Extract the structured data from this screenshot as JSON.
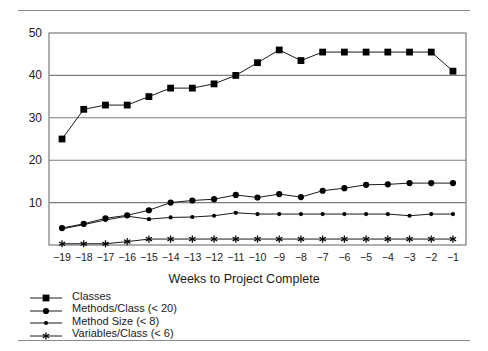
{
  "chart_data": {
    "type": "line",
    "title": "",
    "subtitle": "",
    "xlabel": "Weeks to Project Complete",
    "ylabel": "",
    "x": [
      -19,
      -18,
      -17,
      -16,
      -15,
      -14,
      -13,
      -12,
      -11,
      -10,
      -9,
      -8,
      -7,
      -6,
      -5,
      -4,
      -3,
      -2,
      -1
    ],
    "categories": [
      "-19",
      "-18",
      "-17",
      "-16",
      "-15",
      "-14",
      "-13",
      "-12",
      "-11",
      "-10",
      "-9",
      "-8",
      "-7",
      "-6",
      "-5",
      "-4",
      "-3",
      "-2",
      "-1"
    ],
    "xlim": [
      -19.6,
      -0.4
    ],
    "ylim": [
      0,
      50
    ],
    "yticks": [
      10,
      20,
      30,
      40,
      50
    ],
    "grid": true,
    "legend_position": "below-left",
    "series": [
      {
        "name": "Classes",
        "marker": "square",
        "color": "#000000",
        "values": [
          25,
          32,
          33,
          33,
          35,
          37,
          37,
          38,
          40,
          43,
          46,
          43.5,
          45.5,
          45.5,
          45.5,
          45.5,
          45.5,
          45.5,
          41
        ]
      },
      {
        "name": "Methods/Class (< 20)",
        "marker": "circle-large",
        "color": "#000000",
        "values": [
          4,
          5,
          6.3,
          7,
          8.2,
          10,
          10.5,
          10.8,
          11.8,
          11.2,
          12,
          11.3,
          12.8,
          13.4,
          14.2,
          14.3,
          14.6,
          14.6,
          14.6
        ]
      },
      {
        "name": "Method Size (< 8)",
        "marker": "circle-small",
        "color": "#000000",
        "values": [
          3.8,
          4.8,
          5.9,
          6.8,
          6.1,
          6.5,
          6.6,
          6.9,
          7.6,
          7.3,
          7.3,
          7.3,
          7.3,
          7.3,
          7.3,
          7.3,
          6.9,
          7.3,
          7.3
        ]
      },
      {
        "name": "Variables/Class (< 6)",
        "marker": "asterisk",
        "color": "#000000",
        "values": [
          0.3,
          0.3,
          0.3,
          0.8,
          1.4,
          1.4,
          1.4,
          1.4,
          1.4,
          1.4,
          1.4,
          1.4,
          1.4,
          1.4,
          1.4,
          1.4,
          1.4,
          1.4,
          1.4
        ]
      }
    ]
  },
  "legend": {
    "items": [
      {
        "label": "Classes",
        "marker": "square"
      },
      {
        "label": "Methods/Class (< 20)",
        "marker": "circle-large"
      },
      {
        "label": "Method Size (< 8)",
        "marker": "circle-small"
      },
      {
        "label": "Variables/Class (< 6)",
        "marker": "asterisk"
      }
    ]
  },
  "colors": {
    "ink": "#000000",
    "grid": "#7d7d7d",
    "frame": "#6e6e6e",
    "rule": "#8a8a8a"
  }
}
